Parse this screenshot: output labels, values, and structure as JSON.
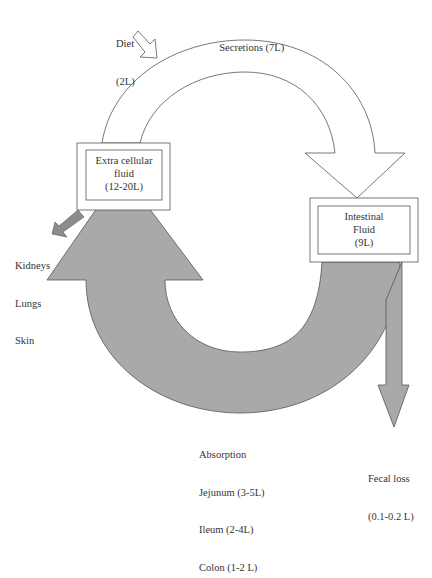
{
  "colors": {
    "flow_gray": "#a9a9a9",
    "stroke": "#555555",
    "background": "#ffffff"
  },
  "labels": {
    "diet": [
      "Diet",
      "(2L)"
    ],
    "secretions": "Secretions (7L)",
    "losses": [
      "Kidneys",
      "Lungs",
      "Skin"
    ],
    "absorption": [
      "Absorption",
      "Jejunum (3-5L)",
      "Ileum (2-4L)",
      "Colon (1-2 L)"
    ],
    "fecal_loss": [
      "Fecal loss",
      "(0.1-0.2 L)"
    ]
  },
  "nodes": {
    "extracellular": [
      "Extra cellular",
      "fluid",
      "(12-20L)"
    ],
    "intestinal": [
      "Intestinal",
      "Fluid",
      "(9L)"
    ]
  },
  "arrows": [
    {
      "from": "Diet",
      "to": "Extra cellular fluid",
      "style": "outline"
    },
    {
      "from": "Extra cellular fluid",
      "to": "Intestinal Fluid",
      "label": "Secretions (7L)",
      "style": "outline"
    },
    {
      "from": "Intestinal Fluid",
      "to": "Extra cellular fluid",
      "label": "Absorption",
      "style": "gray"
    },
    {
      "from": "Extra cellular fluid",
      "to": "Kidneys / Lungs / Skin",
      "style": "gray"
    },
    {
      "from": "Intestinal Fluid",
      "to": "Fecal loss",
      "style": "gray"
    }
  ]
}
